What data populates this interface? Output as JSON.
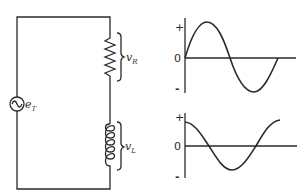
{
  "diagram": {
    "type": "series RL circuit with voltage waveforms",
    "circuit": {
      "source_label": "e",
      "source_subscript": "T",
      "resistor_label": "v",
      "resistor_subscript": "R",
      "inductor_label": "v",
      "inductor_subscript": "L"
    },
    "graphs": [
      {
        "name": "resistor-voltage-waveform",
        "plus_label": "+",
        "zero_label": "0",
        "minus_label": "-",
        "shape": "sine"
      },
      {
        "name": "inductor-voltage-waveform",
        "plus_label": "+",
        "zero_label": "0",
        "minus_label": "-",
        "shape": "cosine"
      }
    ],
    "colors": {
      "ink": "#2a2a2a",
      "background": "#ffffff"
    }
  }
}
